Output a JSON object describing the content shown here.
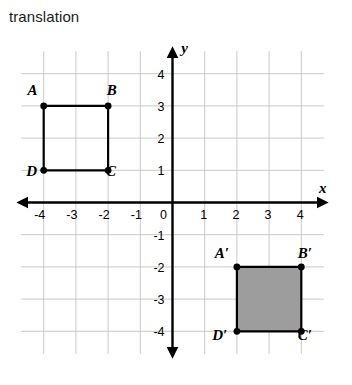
{
  "title": "translation",
  "graph": {
    "x_axis_label": "x",
    "y_axis_label": "y",
    "x_ticks": [
      "-4",
      "-3",
      "-2",
      "-1",
      "0",
      "1",
      "2",
      "3",
      "4"
    ],
    "y_ticks": [
      "4",
      "3",
      "2",
      "1",
      "-1",
      "-2",
      "-3",
      "-4"
    ],
    "origin_label": "0",
    "x_range": [
      -4.7,
      4.7
    ],
    "y_range": [
      -4.7,
      4.7
    ],
    "grid": true
  },
  "shapes": [
    {
      "name": "preimage-square",
      "style": "outline",
      "vertices": [
        {
          "label": "A",
          "x": -4,
          "y": 3,
          "label_dx": -0.55,
          "label_dy": 0.55
        },
        {
          "label": "B",
          "x": -2,
          "y": 3,
          "label_dx": 0.18,
          "label_dy": 0.55
        },
        {
          "label": "C",
          "x": -2,
          "y": 1,
          "label_dx": 0.15,
          "label_dy": -0.3
        },
        {
          "label": "D",
          "x": -4,
          "y": 1,
          "label_dx": -0.6,
          "label_dy": -0.3
        }
      ]
    },
    {
      "name": "image-square",
      "style": "filled",
      "fill_color": "#9d9d9d",
      "vertices": [
        {
          "label": "A′",
          "x": 2,
          "y": -2,
          "label_dx": -0.75,
          "label_dy": 0.42
        },
        {
          "label": "B′",
          "x": 4,
          "y": -2,
          "label_dx": 0.18,
          "label_dy": 0.42
        },
        {
          "label": "C′",
          "x": 4,
          "y": -4,
          "label_dx": 0.18,
          "label_dy": -0.42
        },
        {
          "label": "D′",
          "x": 2,
          "y": -4,
          "label_dx": -0.85,
          "label_dy": -0.42
        }
      ]
    }
  ]
}
